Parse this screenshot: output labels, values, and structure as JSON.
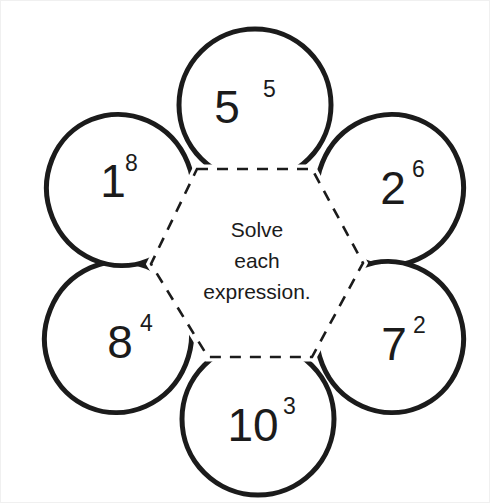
{
  "page": {
    "background_color": "#ffffff",
    "stroke_color": "#1b1b1b",
    "text_color": "#1b1b1b",
    "border_color": "#f0f0f0"
  },
  "center": {
    "name": "center-hexagon",
    "instruction_lines": [
      "Solve",
      "each",
      "expression."
    ],
    "instruction_full": "Solve each expression.",
    "outline_style": "dashed"
  },
  "petals": [
    {
      "id": "petal-top",
      "position": "top",
      "base": "5",
      "exponent": "5",
      "expression": "5^5"
    },
    {
      "id": "petal-upper-right",
      "position": "upper-right",
      "base": "2",
      "exponent": "6",
      "expression": "2^6"
    },
    {
      "id": "petal-lower-right",
      "position": "lower-right",
      "base": "7",
      "exponent": "2",
      "expression": "7^2"
    },
    {
      "id": "petal-bottom",
      "position": "bottom",
      "base": "10",
      "exponent": "3",
      "expression": "10^3"
    },
    {
      "id": "petal-lower-left",
      "position": "lower-left",
      "base": "8",
      "exponent": "4",
      "expression": "8^4"
    },
    {
      "id": "petal-upper-left",
      "position": "upper-left",
      "base": "1",
      "exponent": "8",
      "expression": "1^8"
    }
  ]
}
